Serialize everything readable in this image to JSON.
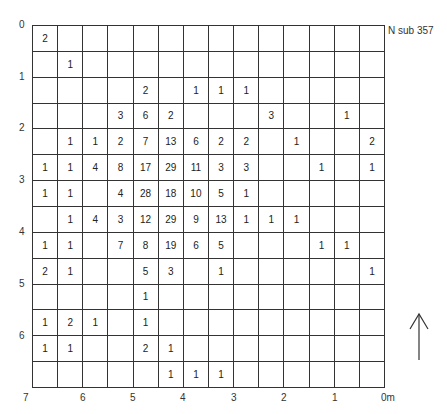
{
  "title": "N sub 357",
  "y_labels": [
    {
      "text": "0",
      "top": 19
    },
    {
      "text": "1",
      "top": 71
    },
    {
      "text": "2",
      "top": 122
    },
    {
      "text": "3",
      "top": 174
    },
    {
      "text": "4",
      "top": 226
    },
    {
      "text": "5",
      "top": 278
    },
    {
      "text": "6",
      "top": 330
    },
    {
      "text": "7",
      "top": 386
    }
  ],
  "x_labels": [
    {
      "text": "6",
      "left": 80
    },
    {
      "text": "5",
      "left": 130
    },
    {
      "text": "4",
      "left": 180
    },
    {
      "text": "3",
      "left": 231
    },
    {
      "text": "2",
      "left": 281
    },
    {
      "text": "1",
      "left": 332
    },
    {
      "text": "0m",
      "left": 381
    }
  ],
  "grid": [
    [
      "2",
      "",
      "",
      "",
      "",
      "",
      "",
      "",
      "",
      "",
      "",
      "",
      "",
      ""
    ],
    [
      "",
      "1",
      "",
      "",
      "",
      "",
      "",
      "",
      "",
      "",
      "",
      "",
      "",
      ""
    ],
    [
      "",
      "",
      "",
      "",
      "2",
      "",
      "1",
      "1",
      "1",
      "",
      "",
      "",
      "",
      ""
    ],
    [
      "",
      "",
      "",
      "3",
      "6",
      "2",
      "",
      "",
      "",
      "3",
      "",
      "",
      "1",
      ""
    ],
    [
      "",
      "1",
      "1",
      "2",
      "7",
      "13",
      "6",
      "2",
      "2",
      "",
      "1",
      "",
      "",
      "2"
    ],
    [
      "1",
      "1",
      "4",
      "8",
      "17",
      "29",
      "11",
      "3",
      "3",
      "",
      "",
      "1",
      "",
      "1"
    ],
    [
      "1",
      "1",
      "",
      "4",
      "28",
      "18",
      "10",
      "5",
      "1",
      "",
      "",
      "",
      "",
      ""
    ],
    [
      "",
      "1",
      "4",
      "3",
      "12",
      "29",
      "9",
      "13",
      "1",
      "1",
      "1",
      "",
      "",
      ""
    ],
    [
      "1",
      "1",
      "",
      "7",
      "8",
      "19",
      "6",
      "5",
      "",
      "",
      "",
      "1",
      "1",
      ""
    ],
    [
      "2",
      "1",
      "",
      "",
      "5",
      "3",
      "",
      "1",
      "",
      "",
      "",
      "",
      "",
      "1"
    ],
    [
      "",
      "",
      "",
      "",
      "1",
      "",
      "",
      "",
      "",
      "",
      "",
      "",
      "",
      ""
    ],
    [
      "1",
      "2",
      "1",
      "",
      "1",
      "",
      "",
      "",
      "",
      "",
      "",
      "",
      "",
      ""
    ],
    [
      "1",
      "1",
      "",
      "",
      "2",
      "1",
      "",
      "",
      "",
      "",
      "",
      "",
      "",
      ""
    ],
    [
      "",
      "",
      "",
      "",
      "",
      "1",
      "1",
      "1",
      "",
      "",
      "",
      "",
      "",
      ""
    ]
  ],
  "north_arrow": "north-arrow"
}
